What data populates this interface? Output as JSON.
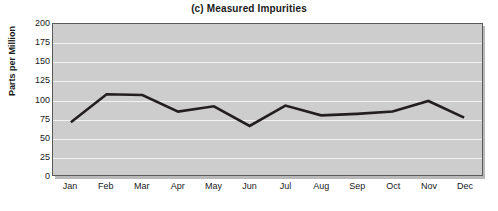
{
  "chart_data": {
    "type": "line",
    "title": "(c) Measured Impurities",
    "xlabel": "",
    "ylabel": "Parts per Million",
    "categories": [
      "Jan",
      "Feb",
      "Mar",
      "Apr",
      "May",
      "Jun",
      "Jul",
      "Aug",
      "Sep",
      "Oct",
      "Nov",
      "Dec"
    ],
    "values": [
      70,
      107,
      106,
      84,
      91,
      65,
      92,
      79,
      81,
      84,
      98,
      76
    ],
    "series": [
      {
        "name": "Measured Impurities",
        "values": [
          70,
          107,
          106,
          84,
          91,
          65,
          92,
          79,
          81,
          84,
          98,
          76
        ]
      }
    ],
    "ylim": [
      0,
      200
    ],
    "yticks": [
      0,
      25,
      50,
      75,
      100,
      125,
      150,
      175,
      200
    ],
    "ytick_labels": [
      "0",
      "25",
      "50",
      "75",
      "100",
      "125",
      "150",
      "175",
      "200"
    ],
    "grid": true,
    "grid_axis": "y",
    "legend": false,
    "legend_position": "none",
    "plot_background_color": "#cdcdcd",
    "gridline_color": "#f2f2f2",
    "line_color": "#231f20",
    "line_width": 2.6,
    "axis_border_color": "#5a5a5a",
    "figure_background_color": "#ffffff",
    "text_color": "#1a1a1a"
  }
}
